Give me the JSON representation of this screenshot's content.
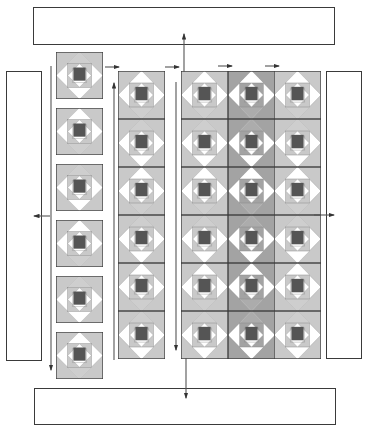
{
  "diagram": {
    "title": "",
    "caption": "",
    "colors": {
      "light_gray": "#c9c9c9",
      "mid_gray": "#a3a3a3",
      "dark_center": "#555555",
      "outline": "#3a3a3a",
      "white": "#ffffff"
    },
    "borders": {
      "top": {
        "label": ""
      },
      "bottom": {
        "label": ""
      },
      "left": {
        "label": ""
      },
      "right": {
        "label": ""
      }
    },
    "individual_blocks": {
      "count": 6,
      "variant": "light"
    },
    "block_strip": {
      "rows": 6,
      "variant": "light"
    },
    "assembled_quilt": {
      "rows": 6,
      "columns": 3,
      "column_variants": [
        "light",
        "dark",
        "light"
      ]
    }
  }
}
